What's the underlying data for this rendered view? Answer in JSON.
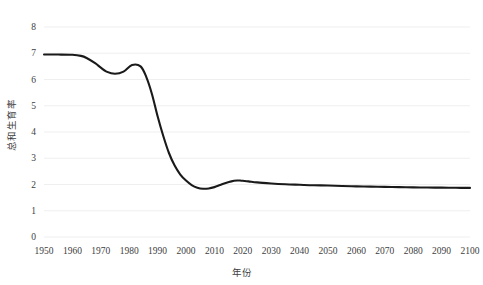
{
  "chart_data": {
    "type": "line",
    "title": "",
    "xlabel": "年份",
    "ylabel": "总和生育率",
    "xlim": [
      1950,
      2100
    ],
    "ylim": [
      0,
      8
    ],
    "grid": true,
    "legend": "none",
    "x_ticks": [
      "1950",
      "1960",
      "1970",
      "1980",
      "1990",
      "2000",
      "2010",
      "2020",
      "2030",
      "2040",
      "2050",
      "2060",
      "2070",
      "2080",
      "2090",
      "2100"
    ],
    "y_ticks": [
      "0",
      "1",
      "2",
      "3",
      "4",
      "5",
      "6",
      "7",
      "8"
    ],
    "line_color": "#1a1a1a",
    "grid_color": "#efefef",
    "series": [
      {
        "name": "总和生育率",
        "x": [
          1950,
          1955,
          1960,
          1963,
          1965,
          1968,
          1970,
          1972,
          1975,
          1978,
          1981,
          1984,
          1986,
          1988,
          1990,
          1992,
          1994,
          1996,
          1998,
          2000,
          2002,
          2004,
          2006,
          2008,
          2010,
          2012,
          2014,
          2016,
          2018,
          2019,
          2020,
          2022,
          2025,
          2030,
          2035,
          2040,
          2045,
          2050,
          2055,
          2060,
          2065,
          2070,
          2075,
          2080,
          2085,
          2090,
          2095,
          2100
        ],
        "values": [
          6.95,
          6.95,
          6.94,
          6.9,
          6.82,
          6.62,
          6.45,
          6.3,
          6.22,
          6.3,
          6.55,
          6.5,
          6.1,
          5.45,
          4.6,
          3.85,
          3.2,
          2.72,
          2.38,
          2.15,
          1.98,
          1.88,
          1.84,
          1.85,
          1.9,
          1.98,
          2.06,
          2.12,
          2.15,
          2.15,
          2.14,
          2.12,
          2.08,
          2.04,
          2.01,
          1.99,
          1.97,
          1.96,
          1.94,
          1.93,
          1.92,
          1.91,
          1.9,
          1.89,
          1.885,
          1.88,
          1.875,
          1.87
        ]
      }
    ]
  }
}
